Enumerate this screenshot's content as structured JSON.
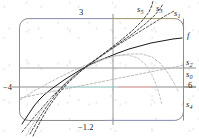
{
  "figure": {
    "frame": {
      "stroke": "#8a8a8a",
      "corner_radius": 9
    },
    "axes": {
      "x_axis_color": "#7c7c7c",
      "y_axis_color": "#7c7c7c",
      "tick_labels": {
        "top": "3",
        "bottom": "−1.2",
        "left": "−4",
        "right": "6"
      }
    },
    "curve_labels": [
      {
        "id": "s5",
        "base": "s",
        "sub": "5"
      },
      {
        "id": "s3",
        "base": "s",
        "sub": "3"
      },
      {
        "id": "s1",
        "base": "s",
        "sub": "1"
      },
      {
        "id": "f",
        "base": "f",
        "sub": ""
      },
      {
        "id": "s2",
        "base": "s",
        "sub": "2"
      },
      {
        "id": "s0",
        "base": "s",
        "sub": "0"
      },
      {
        "id": "s4",
        "base": "s",
        "sub": "4"
      }
    ]
  },
  "chart_data": {
    "type": "line",
    "title": "",
    "xlabel": "",
    "ylabel": "",
    "xlim": [
      -1.2,
      3
    ],
    "ylim": [
      -4,
      6
    ],
    "grid": false,
    "axis_ticks": {
      "x": [
        -1.2,
        3
      ],
      "y": [
        -4,
        6
      ]
    },
    "legend_position": "right-edge-inline",
    "series": [
      {
        "name": "f",
        "label": "f",
        "style": "solid",
        "color": "#1a1a1a",
        "width": 1.0,
        "points_px": [
          [
            22,
            124
          ],
          [
            26,
            118
          ],
          [
            30,
            112
          ],
          [
            34,
            106
          ],
          [
            39,
            100
          ],
          [
            44,
            95
          ],
          [
            50,
            90
          ],
          [
            57,
            85
          ],
          [
            64,
            80
          ],
          [
            72,
            75
          ],
          [
            80,
            70
          ],
          [
            89,
            65
          ],
          [
            98,
            61
          ],
          [
            108,
            57
          ],
          [
            118,
            53
          ],
          [
            129,
            49
          ],
          [
            140,
            46
          ],
          [
            151,
            43
          ],
          [
            162,
            41
          ],
          [
            173,
            39
          ],
          [
            182,
            38
          ]
        ]
      },
      {
        "name": "s0",
        "label": "s0",
        "style": "dashed",
        "color": "#b2b2b2",
        "width": 0.9,
        "points_px": [
          [
            20,
            98
          ],
          [
            40,
            94
          ],
          [
            60,
            90
          ],
          [
            80,
            86
          ],
          [
            100,
            82
          ],
          [
            120,
            78
          ],
          [
            140,
            74
          ],
          [
            160,
            70
          ],
          [
            180,
            66
          ],
          [
            184,
            65
          ]
        ]
      },
      {
        "name": "s1",
        "label": "s1",
        "style": "dashed",
        "color": "#4a4a4a",
        "width": 0.9,
        "points_px": [
          [
            22,
            132
          ],
          [
            35,
            116
          ],
          [
            48,
            101
          ],
          [
            61,
            88
          ],
          [
            74,
            76
          ],
          [
            87,
            66
          ],
          [
            100,
            57
          ],
          [
            113,
            48
          ],
          [
            126,
            40
          ],
          [
            139,
            32
          ],
          [
            152,
            24
          ],
          [
            165,
            16
          ],
          [
            174,
            11
          ]
        ]
      },
      {
        "name": "s2",
        "label": "s2",
        "style": "dashed",
        "color": "#b8b8b8",
        "width": 0.9,
        "points_px": [
          [
            20,
            100
          ],
          [
            32,
            92
          ],
          [
            45,
            85
          ],
          [
            58,
            78
          ],
          [
            72,
            71
          ],
          [
            86,
            65
          ],
          [
            100,
            60
          ],
          [
            114,
            56
          ],
          [
            128,
            54
          ],
          [
            142,
            54
          ],
          [
            152,
            57
          ],
          [
            160,
            63
          ],
          [
            168,
            73
          ],
          [
            174,
            83
          ],
          [
            178,
            91
          ]
        ]
      },
      {
        "name": "s3",
        "label": "s3",
        "style": "dashed",
        "color": "#3a3a3a",
        "width": 0.9,
        "points_px": [
          [
            30,
            134
          ],
          [
            38,
            120
          ],
          [
            47,
            106
          ],
          [
            57,
            93
          ],
          [
            68,
            81
          ],
          [
            80,
            71
          ],
          [
            92,
            62
          ],
          [
            105,
            53
          ],
          [
            118,
            44
          ],
          [
            131,
            35
          ],
          [
            144,
            25
          ],
          [
            154,
            16
          ],
          [
            160,
            9
          ],
          [
            163,
            4
          ]
        ]
      },
      {
        "name": "s4",
        "label": "s4",
        "style": "dashed",
        "color": "#c2c2c2",
        "width": 0.9,
        "points_px": [
          [
            26,
            136
          ],
          [
            34,
            122
          ],
          [
            43,
            108
          ],
          [
            53,
            95
          ],
          [
            64,
            84
          ],
          [
            76,
            74
          ],
          [
            89,
            66
          ],
          [
            102,
            60
          ],
          [
            115,
            56
          ],
          [
            128,
            55
          ],
          [
            138,
            58
          ],
          [
            146,
            65
          ],
          [
            152,
            75
          ],
          [
            157,
            87
          ],
          [
            160,
            97
          ],
          [
            162,
            105
          ]
        ]
      },
      {
        "name": "s5",
        "label": "s5",
        "style": "dashed",
        "color": "#2e2e2e",
        "width": 0.9,
        "points_px": [
          [
            33,
            136
          ],
          [
            40,
            122
          ],
          [
            48,
            108
          ],
          [
            58,
            94
          ],
          [
            69,
            82
          ],
          [
            81,
            71
          ],
          [
            94,
            61
          ],
          [
            107,
            51
          ],
          [
            120,
            41
          ],
          [
            132,
            31
          ],
          [
            142,
            21
          ],
          [
            149,
            12
          ],
          [
            152,
            5
          ],
          [
            153,
            1
          ]
        ]
      }
    ]
  }
}
